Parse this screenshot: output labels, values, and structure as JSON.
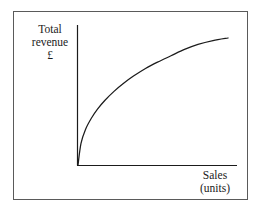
{
  "figure": {
    "name": "total-revenue-vs-sales-curve",
    "background_color": "#ffffff",
    "frame_color": "#5a5a5a",
    "curve_color": "#1b1b1b",
    "axis_color": "#1b1b1b"
  },
  "labels": {
    "y_axis": {
      "line1": "Total",
      "line2": "revenue",
      "line3": "£"
    },
    "x_axis": {
      "line1": "Sales",
      "line2": "(units)"
    }
  },
  "chart_data": {
    "type": "line",
    "title": "",
    "subtitle": "",
    "xlabel": "Sales (units)",
    "ylabel": "Total revenue £",
    "grid": false,
    "legend": false,
    "legend_position": "none",
    "axis_ticks": [],
    "tick_labels": [],
    "xlim": [
      0,
      1
    ],
    "ylim": [
      0,
      1
    ],
    "annotations": [],
    "series": [
      {
        "name": "Total revenue",
        "x": [
          0.0,
          0.02,
          0.05,
          0.09,
          0.13,
          0.18,
          0.24,
          0.3,
          0.37,
          0.45,
          0.53,
          0.62,
          0.71,
          0.8,
          0.9,
          1.0
        ],
        "y": [
          0.0,
          0.17,
          0.28,
          0.37,
          0.44,
          0.51,
          0.58,
          0.64,
          0.7,
          0.76,
          0.81,
          0.86,
          0.91,
          0.95,
          0.98,
          1.0
        ]
      }
    ]
  }
}
